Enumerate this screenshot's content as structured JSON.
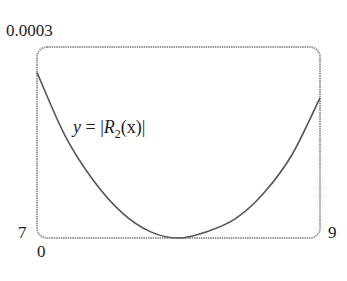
{
  "chart_data": {
    "type": "line",
    "title": "",
    "xlabel": "",
    "ylabel": "",
    "xlim": [
      7,
      9
    ],
    "ylim": [
      0,
      0.0003
    ],
    "tick_labels": {
      "y_top": "0.0003",
      "y_bottom": "0",
      "x_left": "7",
      "x_right": "9"
    },
    "grid": false,
    "legend": null,
    "annotation": "y = |R2(x)|",
    "series": [
      {
        "name": "y = |R2(x)|",
        "x": [
          7.0,
          7.2,
          7.4,
          7.6,
          7.8,
          8.0,
          8.2,
          8.4,
          8.6,
          8.8,
          9.0
        ],
        "y": [
          0.00026,
          0.00016,
          9e-05,
          4e-05,
          1e-05,
          0.0,
          1e-05,
          3e-05,
          7e-05,
          0.00013,
          0.00022
        ]
      }
    ]
  },
  "labels": {
    "y_top": "0.0003",
    "x_left": "7",
    "y_bottom": "0",
    "x_right": "9",
    "eq_y": "y",
    "eq_eq": " = |",
    "eq_R": "R",
    "eq_sub": "2",
    "eq_rest": "(x)|"
  },
  "colors": {
    "frame": "#9a9a9a",
    "curve": "#555555",
    "text": "#222222"
  }
}
